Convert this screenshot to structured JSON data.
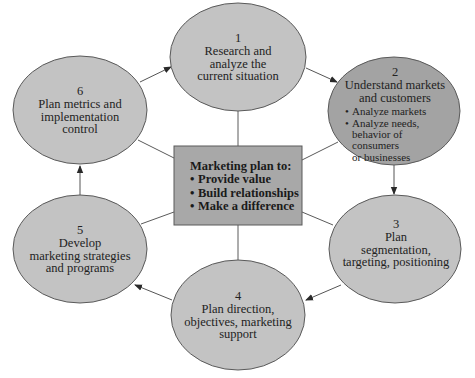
{
  "colors": {
    "node_fill": "#c3c3c3",
    "node_highlight_fill": "#a3a3a3",
    "center_fill": "#a8a8a8",
    "stroke": "#5a5a5a",
    "connector": "#555555",
    "background": "#ffffff"
  },
  "center": {
    "title": "Marketing plan to:",
    "bullets": [
      "Provide value",
      "Build relationships",
      "Make a difference"
    ]
  },
  "steps": [
    {
      "number": "1",
      "lines": [
        "Research and",
        "analyze the",
        "current situation"
      ]
    },
    {
      "number": "2",
      "lines": [
        "Understand markets",
        "and customers"
      ],
      "bullets": [
        "Analyze markets",
        "Analyze needs,",
        "behavior of consumers",
        "or businesses"
      ]
    },
    {
      "number": "3",
      "lines": [
        "Plan",
        "segmentation,",
        "targeting, positioning"
      ]
    },
    {
      "number": "4",
      "lines": [
        "Plan direction,",
        "objectives, marketing",
        "support"
      ]
    },
    {
      "number": "5",
      "lines": [
        "Develop",
        "marketing strategies",
        "and programs"
      ]
    },
    {
      "number": "6",
      "lines": [
        "Plan metrics and",
        "implementation",
        "control"
      ]
    }
  ],
  "flow": [
    "1 → 2",
    "2 → 3",
    "3 → 4",
    "4 → 5",
    "5 → 6",
    "6 → 1"
  ]
}
